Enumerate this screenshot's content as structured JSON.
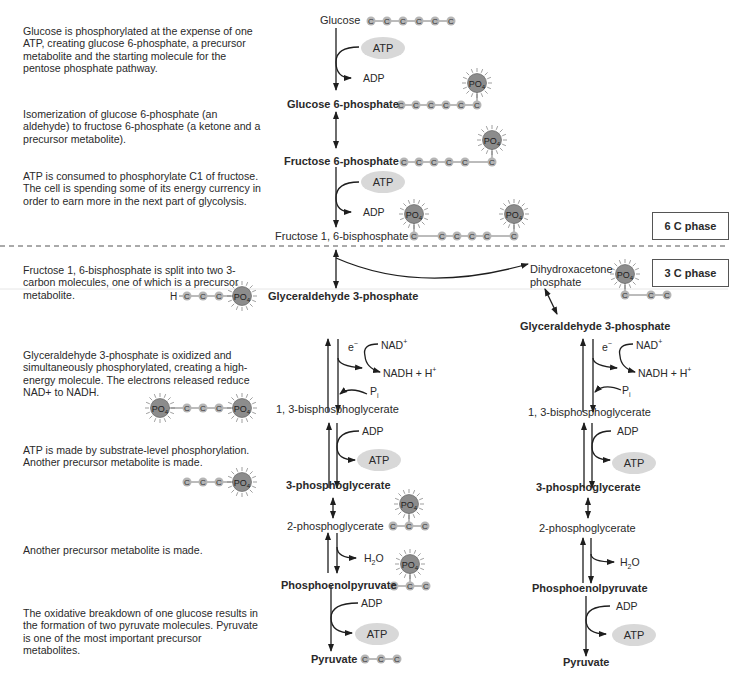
{
  "descriptions": [
    {
      "id": "step1",
      "text": "Glucose is phosphorylated at the expense of one ATP, creating glucose 6-phosphate, a precursor metabolite and the starting molecule for the pentose phosphate pathway."
    },
    {
      "id": "step2",
      "text": "Isomerization of glucose 6-phosphate (an aldehyde) to fructose 6-phosphate (a ketone and a precursor metabolite)."
    },
    {
      "id": "step3",
      "text": "ATP is consumed to phosphorylate C1 of fructose. The cell is spending some of its energy currency in order to earn more in the next part of glycolysis."
    },
    {
      "id": "step4",
      "text": "Fructose 1, 6-bisphosphate is split into two 3-carbon molecules, one of which is a precursor metabolite."
    },
    {
      "id": "step5",
      "text": "Glyceraldehyde 3-phosphate is oxidized and simultaneously phosphorylated, creating a high-energy molecule. The electrons released reduce NAD+ to NADH."
    },
    {
      "id": "step6",
      "text": "ATP is made by substrate-level phosphorylation. Another precursor metabolite is made."
    },
    {
      "id": "step7",
      "text": "Another precursor metabolite is made."
    },
    {
      "id": "step8",
      "text": "The oxidative breakdown of one glucose results in the formation of two pyruvate molecules. Pyruvate is one of the most important precursor metabolites."
    }
  ],
  "metabolites": {
    "glucose": "Glucose",
    "g6p": "Glucose 6-phosphate",
    "f6p": "Fructose 6-phosphate",
    "f16bp": "Fructose 1, 6-bisphosphate",
    "dhap_line1": "Dihydroxacetone",
    "dhap_line2": "phosphate",
    "g3p": "Glyceraldehyde 3-phosphate",
    "bpg13": "1, 3-bisphosphoglycerate",
    "pg3": "3-phosphoglycerate",
    "pg2": "2-phosphoglycerate",
    "pep": "Phosphoenolpyruvate",
    "pyruvate": "Pyruvate"
  },
  "cofactors": {
    "atp": "ATP",
    "adp": "ADP",
    "e": "e",
    "nad": "NAD",
    "nadh": "NADH + H",
    "pi": "P",
    "h2o_h": "H",
    "h2o_o": "O",
    "po4": "PO",
    "carbon": "C",
    "hydrogen": "H"
  },
  "phases": {
    "six_c": "6 C phase",
    "three_c": "3 C phase"
  },
  "colors": {
    "carbon_fill": "#b5b5b5",
    "po4_fill": "#8c8c8c",
    "atp_fill": "#d8d8d8",
    "arrow": "#1e1e1e",
    "dashed": "#555555"
  }
}
